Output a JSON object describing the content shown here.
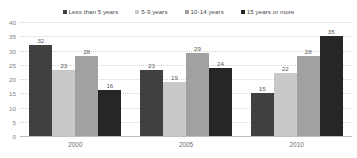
{
  "chart_data": {
    "type": "bar",
    "title": "",
    "subtitle": "",
    "xlabel": "",
    "ylabel": "",
    "categories": [
      "2000",
      "2005",
      "2010"
    ],
    "series": [
      {
        "name": "Less than 5 years",
        "color": "#404040",
        "values": [
          32,
          23,
          15
        ]
      },
      {
        "name": "5-9 years",
        "color": "#c9c9c9",
        "values": [
          23,
          19,
          22
        ]
      },
      {
        "name": "10-14 years",
        "color": "#a1a1a1",
        "values": [
          28,
          29,
          28
        ]
      },
      {
        "name": "15 years or more",
        "color": "#262626",
        "values": [
          16,
          24,
          35
        ]
      }
    ],
    "ylim": [
      0,
      40
    ],
    "yticks": [
      "0",
      "5",
      "10",
      "15",
      "20",
      "25",
      "30",
      "35",
      "40"
    ],
    "grid": true,
    "legend_position": "top",
    "data_labels": true
  }
}
